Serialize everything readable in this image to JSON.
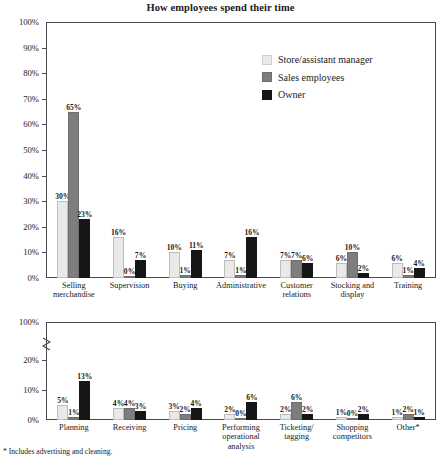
{
  "title": "How employees spend their time",
  "footnote": "* Includes advertising and cleaning.",
  "legend": {
    "items": [
      {
        "label": "Store/assistant manager",
        "color": "#e9e9e9",
        "icon": "legend-swatch-icon"
      },
      {
        "label": "Sales employees",
        "color": "#7d7d7d",
        "icon": "legend-swatch-icon"
      },
      {
        "label": "Owner",
        "color": "#161616",
        "icon": "legend-swatch-icon"
      }
    ]
  },
  "chart_data": [
    {
      "type": "bar",
      "title": "How employees spend their time",
      "panel": "top",
      "xlabel": "",
      "ylabel": "",
      "ylim": [
        0,
        100
      ],
      "ytick_labels": [
        "0%",
        "10%",
        "20%",
        "30%",
        "40%",
        "50%",
        "60%",
        "70%",
        "80%",
        "90%",
        "100%"
      ],
      "ytick_values": [
        0,
        10,
        20,
        30,
        40,
        50,
        60,
        70,
        80,
        90,
        100
      ],
      "grid": false,
      "legend_position": "top-right",
      "categories": [
        "Selling\nmerchandise",
        "Supervision",
        "Buying",
        "Administrative",
        "Customer\nrelations",
        "Stocking and\ndisplay",
        "Training"
      ],
      "series": [
        {
          "name": "Store/assistant manager",
          "values": [
            30,
            16,
            10,
            7,
            7,
            6,
            6
          ],
          "labels": [
            "30%",
            "16%",
            "10%",
            "7%",
            "7%",
            "6%",
            "6%"
          ]
        },
        {
          "name": "Sales employees",
          "values": [
            65,
            0,
            1,
            1,
            7,
            10,
            1
          ],
          "labels": [
            "65%",
            "0%",
            "1%",
            "1%",
            "7%",
            "10%",
            "1%"
          ]
        },
        {
          "name": "Owner",
          "values": [
            23,
            7,
            11,
            16,
            6,
            2,
            4
          ],
          "labels": [
            "23%",
            "7%",
            "11%",
            "16%",
            "6%",
            "2%",
            "4%"
          ]
        }
      ]
    },
    {
      "type": "bar",
      "panel": "bottom",
      "xlabel": "",
      "ylabel": "",
      "ylim": [
        0,
        100
      ],
      "axis_break": true,
      "axis_break_note": "y-axis broken between 20% and 100%",
      "ytick_labels": [
        "0%",
        "10%",
        "20%",
        "100%"
      ],
      "ytick_values": [
        0,
        10,
        20,
        100
      ],
      "grid": false,
      "categories": [
        "Planning",
        "Receiving",
        "Pricing",
        "Performing\noperational\nanalysis",
        "Ticketing/\ntagging",
        "Shopping\ncompetitors",
        "Other*"
      ],
      "series": [
        {
          "name": "Store/assistant manager",
          "values": [
            5,
            4,
            3,
            2,
            2,
            1,
            1
          ],
          "labels": [
            "5%",
            "4%",
            "3%",
            "2%",
            "2%",
            "1%",
            "1%"
          ]
        },
        {
          "name": "Sales employees",
          "values": [
            1,
            4,
            2,
            0,
            6,
            0,
            2
          ],
          "labels": [
            "1%",
            "4%",
            "2%",
            "0%",
            "6%",
            "0%",
            "2%"
          ]
        },
        {
          "name": "Owner",
          "values": [
            13,
            3,
            4,
            6,
            2,
            2,
            1
          ],
          "labels": [
            "13%",
            "3%",
            "4%",
            "6%",
            "2%",
            "2%",
            "1%"
          ]
        }
      ]
    }
  ]
}
